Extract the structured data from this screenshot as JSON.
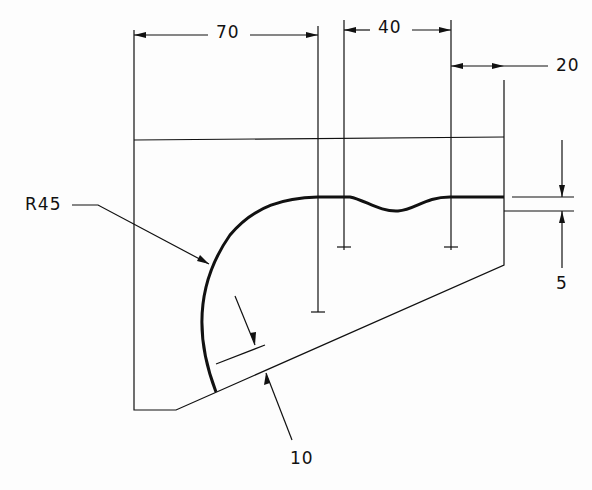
{
  "drawing": {
    "type": "engineering-sketch",
    "dimensions": {
      "d70": "70",
      "d40": "40",
      "d20": "20",
      "d5": "5",
      "r45": "R45",
      "d10": "10"
    },
    "line_color": "#111111",
    "background": "#fdfdfd"
  }
}
